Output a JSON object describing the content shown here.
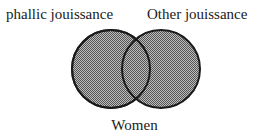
{
  "diagram": {
    "type": "venn",
    "labels": {
      "left_circle": "phallic jouissance",
      "right_circle": "Other jouissance",
      "bottom": "Women"
    },
    "circles": [
      {
        "name": "phallic jouissance",
        "cx": 111,
        "cy": 69,
        "r": 39
      },
      {
        "name": "Other jouissance",
        "cx": 161,
        "cy": 69,
        "r": 39
      }
    ],
    "colors": {
      "fill": "#8c8c8c",
      "stroke": "#1a1a1a",
      "background": "#ffffff"
    }
  }
}
